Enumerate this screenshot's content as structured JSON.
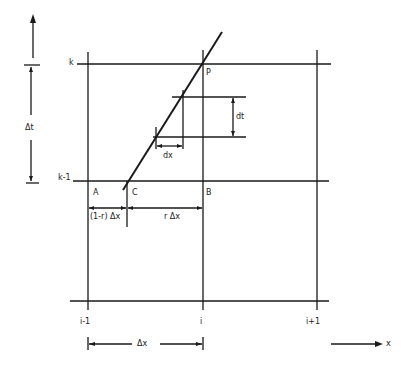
{
  "diagram": {
    "type": "finite-difference characteristic grid",
    "time_axis": {
      "label": "Δt",
      "arrow": "up"
    },
    "space_axis": {
      "label": "x",
      "arrow": "right"
    },
    "row_labels": {
      "top": "k",
      "middle": "k-1"
    },
    "column_labels": {
      "left": "i-1",
      "middle": "i",
      "right": "i+1"
    },
    "points": {
      "A": "A",
      "B": "B",
      "C": "C",
      "P": "P"
    },
    "segments": {
      "left": "(1-r) Δx",
      "right": "r Δx"
    },
    "increments": {
      "dx": "dx",
      "dt": "dt"
    },
    "bottom_span": "Δx"
  },
  "colors": {
    "ink": "#1a1a1a",
    "background": "#ffffff"
  }
}
